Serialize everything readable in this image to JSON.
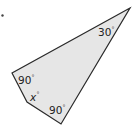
{
  "figure": {
    "shape": "quadrilateral",
    "fill_color": "#e6e6e6",
    "stroke_color": "#2a2a2a",
    "vertices": [
      [
        130,
        8
      ],
      [
        12,
        73
      ],
      [
        27,
        102
      ],
      [
        61,
        124
      ]
    ],
    "angles": [
      {
        "vertex": "top-right",
        "value": "30",
        "unit": "°"
      },
      {
        "vertex": "left",
        "value": "90",
        "unit": "°"
      },
      {
        "vertex": "lower-left",
        "value": "x",
        "unit": "°"
      },
      {
        "vertex": "bottom",
        "value": "90",
        "unit": "°"
      }
    ]
  },
  "marker": {
    "label": "•"
  }
}
